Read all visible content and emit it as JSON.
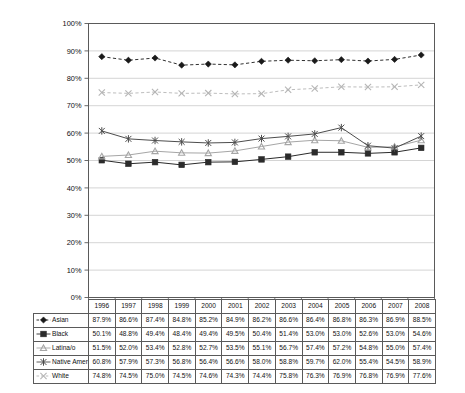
{
  "chart_data": {
    "type": "line",
    "title": "",
    "subtitle": "",
    "xlabel": "",
    "ylabel": "",
    "categories": [
      "1996",
      "1997",
      "1998",
      "1999",
      "2000",
      "2001",
      "2002",
      "2003",
      "2004",
      "2005",
      "2006",
      "2007",
      "2008"
    ],
    "ylim": [
      0,
      100
    ],
    "ytick_labels": [
      "100%",
      "90%",
      "80%",
      "70%",
      "60%",
      "50%",
      "40%",
      "30%",
      "20%",
      "10%",
      "0%"
    ],
    "ytick_values": [
      100,
      90,
      80,
      70,
      60,
      50,
      40,
      30,
      20,
      10,
      0
    ],
    "grid": "horizontal",
    "legend_position": "table-below",
    "value_suffix": "%",
    "series": [
      {
        "name": "Asian",
        "marker": "diamond",
        "line_style": "dashed",
        "color": "#1a1a1a",
        "values": [
          87.9,
          86.6,
          87.4,
          84.8,
          85.2,
          84.9,
          86.2,
          86.6,
          86.4,
          86.8,
          86.3,
          86.9,
          88.5
        ],
        "labels": [
          "87.9%",
          "86.6%",
          "87.4%",
          "84.8%",
          "85.2%",
          "84.9%",
          "86.2%",
          "86.6%",
          "86.4%",
          "86.8%",
          "86.3%",
          "86.9%",
          "88.5%"
        ]
      },
      {
        "name": "Black",
        "marker": "square",
        "line_style": "solid",
        "color": "#2b2b2b",
        "values": [
          50.1,
          48.8,
          49.4,
          48.4,
          49.4,
          49.5,
          50.4,
          51.4,
          53.0,
          53.0,
          52.6,
          53.0,
          54.6
        ],
        "labels": [
          "50.1%",
          "48.8%",
          "49.4%",
          "48.4%",
          "49.4%",
          "49.5%",
          "50.4%",
          "51.4%",
          "53.0%",
          "53.0%",
          "52.6%",
          "53.0%",
          "54.6%"
        ]
      },
      {
        "name": "Latina/o",
        "marker": "triangle",
        "line_style": "solid",
        "color": "#a6a6a6",
        "values": [
          51.5,
          52.0,
          53.4,
          52.8,
          52.7,
          53.5,
          55.1,
          56.7,
          57.4,
          57.2,
          54.8,
          55.0,
          57.4
        ],
        "labels": [
          "51.5%",
          "52.0%",
          "53.4%",
          "52.8%",
          "52.7%",
          "53.5%",
          "55.1%",
          "56.7%",
          "57.4%",
          "57.2%",
          "54.8%",
          "55.0%",
          "57.4%"
        ]
      },
      {
        "name": "Native American",
        "marker": "asterisk",
        "line_style": "solid",
        "color": "#4d4d4d",
        "values": [
          60.8,
          57.9,
          57.3,
          56.8,
          56.4,
          56.6,
          58.0,
          58.8,
          59.7,
          62.0,
          55.4,
          54.5,
          58.9
        ],
        "labels": [
          "60.8%",
          "57.9%",
          "57.3%",
          "56.8%",
          "56.4%",
          "56.6%",
          "58.0%",
          "58.8%",
          "59.7%",
          "62.0%",
          "55.4%",
          "54.5%",
          "58.9%"
        ]
      },
      {
        "name": "White",
        "marker": "x",
        "line_style": "dashed",
        "color": "#b5b5b5",
        "values": [
          74.8,
          74.5,
          75.0,
          74.5,
          74.6,
          74.3,
          74.4,
          75.8,
          76.3,
          76.9,
          76.8,
          76.9,
          77.6
        ],
        "labels": [
          "74.8%",
          "74.5%",
          "75.0%",
          "74.5%",
          "74.6%",
          "74.3%",
          "74.4%",
          "75.8%",
          "76.3%",
          "76.9%",
          "76.8%",
          "76.9%",
          "77.6%"
        ]
      }
    ]
  },
  "table": {
    "corner_label": "",
    "column_headers": [
      "1996",
      "1997",
      "1998",
      "1999",
      "2000",
      "2001",
      "2002",
      "2003",
      "2004",
      "2005",
      "2006",
      "2007",
      "2008"
    ]
  },
  "colors": {
    "axis": "#5a5a5a",
    "grid": "#c9c9c9",
    "plot_border": "#5a5a5a",
    "background": "#ffffff",
    "text": "#111111"
  }
}
